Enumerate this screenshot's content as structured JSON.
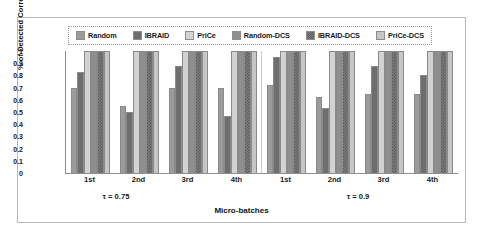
{
  "chart_data": {
    "type": "bar",
    "title": "",
    "xlabel": "Micro-batches",
    "ylabel": "% of Detected Correlated Pairs",
    "ylim": [
      0,
      1
    ],
    "yticks": [
      "0",
      "0.1",
      "0.2",
      "0.3",
      "0.4",
      "0.5",
      "0.6",
      "0.7",
      "0.8",
      "0.9",
      "1"
    ],
    "grid": false,
    "legend_position": "top",
    "categories": [
      "1st",
      "2nd",
      "3rd",
      "4th",
      "1st",
      "2nd",
      "3rd",
      "4th"
    ],
    "panel_labels": [
      "τ = 0.75",
      "τ = 0.9"
    ],
    "panels": [
      {
        "label": "τ = 0.75",
        "categories": [
          "1st",
          "2nd",
          "3rd",
          "4th"
        ]
      },
      {
        "label": "τ = 0.9",
        "categories": [
          "1st",
          "2nd",
          "3rd",
          "4th"
        ]
      }
    ],
    "series": [
      {
        "name": "Random",
        "color": "#9b9b9b",
        "pattern": "solid",
        "values": [
          0.7,
          0.55,
          0.7,
          0.7,
          0.72,
          0.62,
          0.65,
          0.65
        ]
      },
      {
        "name": "IBRAID",
        "color": "#6e6e6e",
        "pattern": "solid",
        "values": [
          0.83,
          0.5,
          0.88,
          0.47,
          0.95,
          0.53,
          0.88,
          0.8
        ]
      },
      {
        "name": "PriCe",
        "color": "#d2d2d2",
        "pattern": "solid",
        "values": [
          1.0,
          1.0,
          1.0,
          1.0,
          1.0,
          1.0,
          1.0,
          1.0
        ]
      },
      {
        "name": "Random-DCS",
        "color": "#8f8f8f",
        "pattern": "solid",
        "values": [
          1.0,
          1.0,
          1.0,
          1.0,
          1.0,
          1.0,
          1.0,
          1.0
        ]
      },
      {
        "name": "IBRAID-DCS",
        "color": "#7d7d7d",
        "pattern": "checkered",
        "values": [
          1.0,
          1.0,
          1.0,
          1.0,
          1.0,
          1.0,
          1.0,
          1.0
        ]
      },
      {
        "name": "PriCe-DCS",
        "color": "#c6c6c6",
        "pattern": "solid",
        "values": [
          1.0,
          1.0,
          1.0,
          1.0,
          1.0,
          1.0,
          1.0,
          1.0
        ]
      }
    ]
  },
  "legend": {
    "items": [
      {
        "label": "Random"
      },
      {
        "label": "IBRAID"
      },
      {
        "label": "PriCe"
      },
      {
        "label": "Random-DCS"
      },
      {
        "label": "IBRAID-DCS"
      },
      {
        "label": "PriCe-DCS"
      }
    ]
  }
}
